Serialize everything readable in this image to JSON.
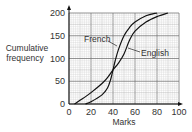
{
  "chart_data": {
    "type": "line",
    "title": "",
    "xlabel": "Marks",
    "ylabel": "Cumulative frequency",
    "xlim": [
      0,
      100
    ],
    "ylim": [
      0,
      200
    ],
    "xticks": [
      0,
      20,
      40,
      60,
      80,
      100
    ],
    "yticks": [
      0,
      50,
      100,
      150,
      200
    ],
    "grid": true,
    "legend": "inline labels with pointer lines",
    "series": [
      {
        "name": "French",
        "x": [
          15,
          20,
          30,
          35,
          38,
          40,
          42,
          45,
          50,
          55,
          60,
          70,
          80
        ],
        "y": [
          0,
          5,
          20,
          35,
          55,
          75,
          95,
          120,
          150,
          168,
          180,
          194,
          200
        ]
      },
      {
        "name": "English",
        "x": [
          5,
          10,
          20,
          30,
          35,
          40,
          45,
          50,
          55,
          60,
          70,
          80,
          90
        ],
        "y": [
          0,
          8,
          25,
          45,
          58,
          75,
          90,
          110,
          140,
          160,
          180,
          192,
          200
        ]
      }
    ],
    "annotations": [
      "French",
      "English"
    ]
  },
  "labels": {
    "xlabel": "Marks",
    "ylabel_line1": "Cumulative",
    "ylabel_line2": "frequency",
    "french": "French",
    "english": "English",
    "x0": "0",
    "x20": "20",
    "x40": "40",
    "x60": "60",
    "x80": "80",
    "x100": "100",
    "y0": "0",
    "y50": "50",
    "y100": "100",
    "y150": "150",
    "y200": "200"
  }
}
